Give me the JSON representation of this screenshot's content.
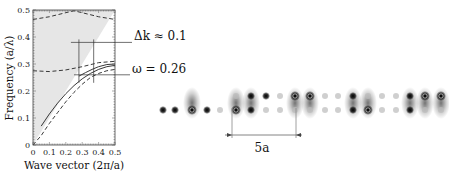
{
  "chart_data": {
    "type": "line",
    "title": "",
    "xlabel": "Wave vector (2π/a)",
    "ylabel": "Frequency (a/λ)",
    "xlim": [
      0,
      0.5
    ],
    "ylim": [
      0,
      0.5
    ],
    "xticks": [
      "0",
      "0.1",
      "0.2",
      "0.3",
      "0.4",
      "0.5"
    ],
    "yticks": [
      "0",
      "0.1",
      "0.2",
      "0.3",
      "0.4",
      "0.5"
    ],
    "light_cone": {
      "description": "shaded light cone region",
      "boundary": [
        [
          0,
          0
        ],
        [
          0.5,
          0.5
        ]
      ]
    },
    "series": [
      {
        "name": "guided band (solid)",
        "style": "solid",
        "x": [
          0.05,
          0.1,
          0.15,
          0.2,
          0.25,
          0.3,
          0.35,
          0.4,
          0.45,
          0.5
        ],
        "y": [
          0.07,
          0.115,
          0.155,
          0.19,
          0.22,
          0.245,
          0.265,
          0.28,
          0.29,
          0.295
        ]
      },
      {
        "name": "lower band edge (dashed)",
        "style": "dashed",
        "x": [
          0.0,
          0.05,
          0.1,
          0.15,
          0.2,
          0.25,
          0.3,
          0.35,
          0.4,
          0.45,
          0.5
        ],
        "y": [
          0.0,
          0.035,
          0.08,
          0.12,
          0.16,
          0.195,
          0.225,
          0.25,
          0.265,
          0.275,
          0.28
        ]
      },
      {
        "name": "upper band (dashed)",
        "style": "dashed",
        "x": [
          0.0,
          0.1,
          0.2,
          0.3,
          0.4,
          0.5
        ],
        "y": [
          0.275,
          0.272,
          0.278,
          0.29,
          0.305,
          0.31
        ]
      },
      {
        "name": "top band (dashed)",
        "style": "dashed",
        "x": [
          0.0,
          0.1,
          0.2,
          0.25,
          0.3,
          0.4,
          0.5
        ],
        "y": [
          0.465,
          0.475,
          0.49,
          0.497,
          0.49,
          0.475,
          0.465
        ]
      },
      {
        "name": "solid band 2",
        "style": "solid",
        "x": [
          0.28,
          0.32,
          0.36,
          0.4,
          0.45,
          0.5
        ],
        "y": [
          0.255,
          0.268,
          0.28,
          0.29,
          0.298,
          0.3
        ]
      }
    ],
    "annotations": [
      {
        "text": "Δk ≈ 0.1",
        "k_range": [
          0.28,
          0.37
        ],
        "frequency": 0.38
      },
      {
        "text": "ω = 0.26",
        "frequency": 0.26
      }
    ]
  },
  "field_pattern": {
    "scale_label": "5a",
    "description": "mode field intensity pattern along waveguide"
  }
}
